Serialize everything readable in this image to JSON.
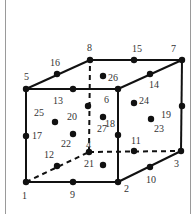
{
  "diagram": {
    "colors": {
      "line": "#111111",
      "label": "#333333",
      "frame": "#9a9a9a"
    },
    "nodes": [
      {
        "id": "1",
        "x": 26,
        "y": 182,
        "lx": 22,
        "ly": 199
      },
      {
        "id": "2",
        "x": 118,
        "y": 182,
        "lx": 124,
        "ly": 192
      },
      {
        "id": "3",
        "x": 181,
        "y": 151,
        "lx": 174,
        "ly": 167
      },
      {
        "id": "4",
        "x": 89,
        "y": 152,
        "lx": 86,
        "ly": 148
      },
      {
        "id": "5",
        "x": 26,
        "y": 89,
        "lx": 24,
        "ly": 80
      },
      {
        "id": "6",
        "x": 118,
        "y": 89,
        "lx": 104,
        "ly": 103
      },
      {
        "id": "7",
        "x": 182,
        "y": 60,
        "lx": 171,
        "ly": 52
      },
      {
        "id": "8",
        "x": 90,
        "y": 60,
        "lx": 87,
        "ly": 51
      },
      {
        "id": "9",
        "x": 73,
        "y": 182,
        "lx": 70,
        "ly": 198
      },
      {
        "id": "10",
        "x": 150,
        "y": 167,
        "lx": 146,
        "ly": 183
      },
      {
        "id": "11",
        "x": 134,
        "y": 151,
        "lx": 131,
        "ly": 144
      },
      {
        "id": "12",
        "x": 57,
        "y": 166,
        "lx": 44,
        "ly": 158
      },
      {
        "id": "13",
        "x": 73,
        "y": 89,
        "lx": 53,
        "ly": 104
      },
      {
        "id": "14",
        "x": 150,
        "y": 74,
        "lx": 149,
        "ly": 88
      },
      {
        "id": "15",
        "x": 134,
        "y": 60,
        "lx": 132,
        "ly": 52
      },
      {
        "id": "16",
        "x": 57,
        "y": 74,
        "lx": 50,
        "ly": 66
      },
      {
        "id": "17",
        "x": 26,
        "y": 136,
        "lx": 32,
        "ly": 139
      },
      {
        "id": "18",
        "x": 118,
        "y": 135,
        "lx": 105,
        "ly": 127
      },
      {
        "id": "19",
        "x": 182,
        "y": 106,
        "lx": 161,
        "ly": 118
      },
      {
        "id": "20",
        "x": 88,
        "y": 106,
        "lx": 67,
        "ly": 120
      },
      {
        "id": "21",
        "x": 103,
        "y": 165,
        "lx": 84,
        "ly": 167
      },
      {
        "id": "22",
        "x": 73,
        "y": 134,
        "lx": 61,
        "ly": 147
      },
      {
        "id": "23",
        "x": 151,
        "y": 119,
        "lx": 154,
        "ly": 132
      },
      {
        "id": "24",
        "x": 134,
        "y": 103,
        "lx": 139,
        "ly": 104
      },
      {
        "id": "25",
        "x": 55,
        "y": 122,
        "lx": 34,
        "ly": 116
      },
      {
        "id": "26",
        "x": 103,
        "y": 76,
        "lx": 108,
        "ly": 81
      },
      {
        "id": "27",
        "x": 103,
        "y": 117,
        "lx": 97,
        "ly": 132
      }
    ],
    "edges": [
      {
        "from": "1",
        "to": "2",
        "style": "solid"
      },
      {
        "from": "2",
        "to": "3",
        "style": "solid"
      },
      {
        "from": "3",
        "to": "7",
        "style": "solid"
      },
      {
        "from": "5",
        "to": "6",
        "style": "solid"
      },
      {
        "from": "6",
        "to": "7",
        "style": "solid"
      },
      {
        "from": "5",
        "to": "8",
        "style": "solid"
      },
      {
        "from": "8",
        "to": "7",
        "style": "solid"
      },
      {
        "from": "1",
        "to": "5",
        "style": "solid"
      },
      {
        "from": "2",
        "to": "6",
        "style": "solid"
      },
      {
        "from": "1",
        "to": "4",
        "style": "dashed"
      },
      {
        "from": "4",
        "to": "3",
        "style": "dashed"
      },
      {
        "from": "4",
        "to": "8",
        "style": "dashed"
      }
    ]
  }
}
